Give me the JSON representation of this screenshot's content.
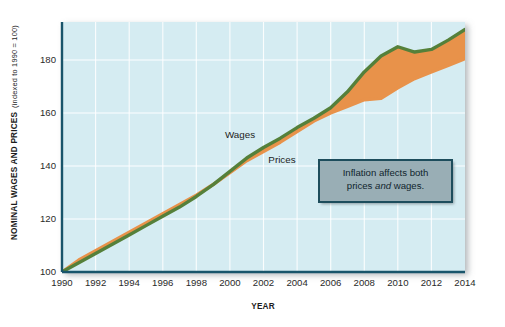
{
  "chart_data": {
    "type": "area",
    "title": "",
    "xlabel": "YEAR",
    "ylabel": "NOMINAL WAGES AND PRICES",
    "ylabel_sub": "(indexed to 1990 = 100)",
    "ylabel_full": "NOMINAL WAGES AND PRICES (indexed to 1990 = 100)",
    "x": [
      1990,
      1991,
      1992,
      1993,
      1994,
      1995,
      1996,
      1997,
      1998,
      1999,
      2000,
      2001,
      2002,
      2003,
      2004,
      2005,
      2006,
      2007,
      2008,
      2009,
      2010,
      2011,
      2012,
      2013,
      2014
    ],
    "xlim": [
      1990,
      2014
    ],
    "ylim": [
      100,
      192
    ],
    "xticks": [
      1990,
      1992,
      1994,
      1996,
      1998,
      2000,
      2002,
      2004,
      2006,
      2008,
      2010,
      2012,
      2014
    ],
    "xtick_labels": [
      "1990",
      "1992",
      "1994",
      "1996",
      "1998",
      "2000",
      "2002",
      "2004",
      "2006",
      "2008",
      "2010",
      "2012",
      "2014"
    ],
    "yticks": [
      100,
      120,
      140,
      160,
      180
    ],
    "ytick_labels": [
      "100",
      "120",
      "140",
      "160",
      "180"
    ],
    "grid": true,
    "legend_position": "inline-labels",
    "series": [
      {
        "name": "Wages",
        "color": "#55803a",
        "label_x": 2000.6,
        "label_y": 150.5,
        "values": [
          100.0,
          103.5,
          107.0,
          110.5,
          114.0,
          117.5,
          121.0,
          124.5,
          128.5,
          133.0,
          138.0,
          143.0,
          147.0,
          150.5,
          154.5,
          158.0,
          162.0,
          168.0,
          175.5,
          181.5,
          185.0,
          183.0,
          184.0,
          187.5,
          191.5
        ]
      },
      {
        "name": "Prices",
        "color": "#e8924a",
        "label_x": 2003.1,
        "label_y": 141.0,
        "values": [
          100.0,
          104.5,
          108.0,
          111.5,
          115.0,
          118.5,
          122.0,
          125.5,
          129.0,
          133.0,
          137.5,
          142.0,
          145.5,
          149.0,
          153.0,
          157.0,
          160.0,
          162.5,
          165.0,
          165.5,
          169.5,
          173.0,
          175.5,
          178.0,
          180.5
        ]
      }
    ],
    "band_fill_color": "#e8924a",
    "plot_background": "#d5ecf2",
    "gridline_color": "#ffffff",
    "axis_color": "#19556b"
  },
  "callout": {
    "line1": "Inflation affects both",
    "line2_before": "prices ",
    "line2_em": "and",
    "line2_after": " wages.",
    "full_text": "Inflation affects both prices and wages.",
    "background": "#99aeb5",
    "border": "#1d4d5c"
  }
}
